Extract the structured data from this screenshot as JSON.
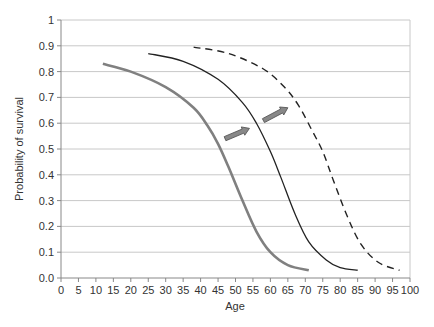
{
  "chart_data": {
    "type": "line",
    "title": "",
    "xlabel": "Age",
    "ylabel": "Probability of survival",
    "xlim": [
      0,
      100
    ],
    "ylim": [
      0,
      1
    ],
    "x_ticks": [
      "0",
      "5",
      "10",
      "15",
      "20",
      "25",
      "30",
      "35",
      "40",
      "45",
      "50",
      "55",
      "60",
      "65",
      "70",
      "75",
      "80",
      "85",
      "90",
      "95",
      "100"
    ],
    "y_ticks": [
      "0.0",
      "0.1",
      "0.2",
      "0.3",
      "0.4",
      "0.5",
      "0.6",
      "0.7",
      "0.8",
      "0.9",
      "1"
    ],
    "grid": {
      "horizontal": true,
      "vertical": false
    },
    "legend": null,
    "series": [
      {
        "name": "Survival curve 1 (gray)",
        "style": "solid-thick-gray",
        "color": "#808080",
        "x": [
          12,
          20,
          30,
          38,
          42,
          45,
          48,
          52,
          56,
          60,
          65,
          71
        ],
        "y": [
          0.83,
          0.8,
          0.74,
          0.66,
          0.59,
          0.52,
          0.43,
          0.3,
          0.18,
          0.1,
          0.05,
          0.03
        ]
      },
      {
        "name": "Survival curve 2 (black)",
        "style": "solid-thin-black",
        "color": "#222222",
        "x": [
          25,
          35,
          45,
          52,
          56,
          60,
          63,
          67,
          71,
          76,
          80,
          85
        ],
        "y": [
          0.87,
          0.84,
          0.77,
          0.68,
          0.6,
          0.49,
          0.39,
          0.25,
          0.14,
          0.07,
          0.04,
          0.03
        ]
      },
      {
        "name": "Survival curve 3 (dashed)",
        "style": "dashed-black",
        "color": "#222222",
        "x": [
          38,
          48,
          58,
          64,
          68,
          72,
          75,
          78,
          82,
          86,
          91,
          97
        ],
        "y": [
          0.895,
          0.87,
          0.81,
          0.74,
          0.67,
          0.57,
          0.49,
          0.38,
          0.24,
          0.13,
          0.06,
          0.03
        ]
      }
    ],
    "annotations": [
      {
        "type": "arrow",
        "from": [
          47,
          0.54
        ],
        "to": [
          54,
          0.58
        ],
        "color": "#888888"
      },
      {
        "type": "arrow",
        "from": [
          58,
          0.61
        ],
        "to": [
          65,
          0.66
        ],
        "color": "#888888"
      }
    ]
  }
}
